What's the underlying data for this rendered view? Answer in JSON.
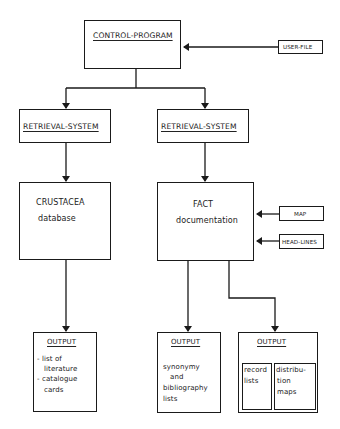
{
  "diagram": {
    "control_program": {
      "label": "CONTROL-PROGRAM"
    },
    "user_file": {
      "label": "USER-FILE"
    },
    "retrieval_left": {
      "label": "RETRIEVAL-SYSTEM"
    },
    "retrieval_right": {
      "label": "RETRIEVAL-SYSTEM"
    },
    "crustacea": {
      "line1": "CRUSTACEA",
      "line2": "database"
    },
    "fact": {
      "line1": "FACT",
      "line2": "documentation"
    },
    "map": {
      "label": "MAP"
    },
    "head_lines": {
      "label": "HEAD-LINES"
    },
    "output_1": {
      "title": "OUTPUT",
      "lines": [
        "- list of",
        "literature",
        "- catalogue",
        "cards"
      ]
    },
    "output_2": {
      "title": "OUTPUT",
      "lines": [
        "synonymy",
        "and",
        "bibliography",
        "lists"
      ]
    },
    "output_3": {
      "title": "OUTPUT",
      "left_lines": [
        "record",
        "lists"
      ],
      "right_lines": [
        "distribu-",
        "tion",
        "maps"
      ]
    }
  }
}
